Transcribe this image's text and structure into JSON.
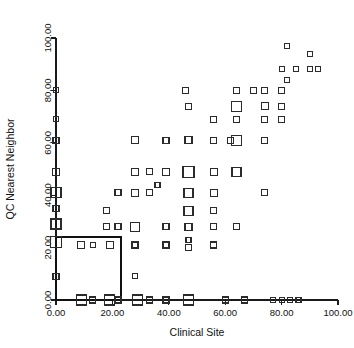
{
  "chart_data": {
    "type": "scatter",
    "title": "",
    "xlabel": "Clinical Site",
    "ylabel": "QC Nearest Neighbor",
    "xlim": [
      0,
      100
    ],
    "ylim": [
      0,
      100
    ],
    "grid": false,
    "legend": null,
    "xticks": [
      0,
      20,
      40,
      60,
      80,
      100
    ],
    "yticks": [
      0,
      20,
      40,
      60,
      80,
      100
    ],
    "xtick_labels": [
      "0.00",
      "20.00",
      "40.00",
      "60.00",
      "80.00",
      "100.00"
    ],
    "ytick_labels": [
      "0.00",
      "20.00",
      "40.00",
      "60.00",
      "80.00",
      "100.00"
    ],
    "marker_shape": "open-square",
    "marker_note": "Marker size varies with bin count; sizes given in px side length.",
    "points": [
      {
        "x": 0,
        "y": 80,
        "size": 5
      },
      {
        "x": 0,
        "y": 69,
        "size": 5
      },
      {
        "x": 0,
        "y": 61,
        "size": 6
      },
      {
        "x": 0,
        "y": 49,
        "size": 7
      },
      {
        "x": 0,
        "y": 41,
        "size": 10
      },
      {
        "x": 0,
        "y": 35,
        "size": 6
      },
      {
        "x": 0,
        "y": 29,
        "size": 10
      },
      {
        "x": 0,
        "y": 22,
        "size": 11
      },
      {
        "x": 0,
        "y": 9,
        "size": 6
      },
      {
        "x": 9,
        "y": 21,
        "size": 7
      },
      {
        "x": 9,
        "y": 0,
        "size": 10
      },
      {
        "x": 13,
        "y": 21,
        "size": 5
      },
      {
        "x": 13,
        "y": 0,
        "size": 6
      },
      {
        "x": 19,
        "y": 21,
        "size": 7
      },
      {
        "x": 19,
        "y": 0,
        "size": 10
      },
      {
        "x": 18,
        "y": 34,
        "size": 6
      },
      {
        "x": 18,
        "y": 28,
        "size": 6
      },
      {
        "x": 22,
        "y": 41,
        "size": 6
      },
      {
        "x": 22,
        "y": 28,
        "size": 6
      },
      {
        "x": 22,
        "y": 0,
        "size": 6
      },
      {
        "x": 28,
        "y": 61,
        "size": 7
      },
      {
        "x": 28,
        "y": 49,
        "size": 7
      },
      {
        "x": 28,
        "y": 41,
        "size": 7
      },
      {
        "x": 28,
        "y": 28,
        "size": 9
      },
      {
        "x": 28,
        "y": 21,
        "size": 6
      },
      {
        "x": 28,
        "y": 9,
        "size": 5
      },
      {
        "x": 29,
        "y": 0,
        "size": 10
      },
      {
        "x": 33,
        "y": 49,
        "size": 6
      },
      {
        "x": 33,
        "y": 41,
        "size": 6
      },
      {
        "x": 33,
        "y": 0,
        "size": 6
      },
      {
        "x": 36,
        "y": 44,
        "size": 5
      },
      {
        "x": 39,
        "y": 61,
        "size": 6
      },
      {
        "x": 39,
        "y": 49,
        "size": 7
      },
      {
        "x": 39,
        "y": 28,
        "size": 6
      },
      {
        "x": 39,
        "y": 21,
        "size": 6
      },
      {
        "x": 39,
        "y": 0,
        "size": 6
      },
      {
        "x": 46,
        "y": 80,
        "size": 6
      },
      {
        "x": 47,
        "y": 74,
        "size": 6
      },
      {
        "x": 47,
        "y": 61,
        "size": 7
      },
      {
        "x": 47,
        "y": 49,
        "size": 11
      },
      {
        "x": 47,
        "y": 41,
        "size": 9
      },
      {
        "x": 47,
        "y": 34,
        "size": 9
      },
      {
        "x": 47,
        "y": 28,
        "size": 7
      },
      {
        "x": 47,
        "y": 23,
        "size": 5
      },
      {
        "x": 47,
        "y": 20,
        "size": 6
      },
      {
        "x": 47,
        "y": 0,
        "size": 10
      },
      {
        "x": 56,
        "y": 69,
        "size": 6
      },
      {
        "x": 56,
        "y": 61,
        "size": 6
      },
      {
        "x": 56,
        "y": 49,
        "size": 7
      },
      {
        "x": 56,
        "y": 41,
        "size": 7
      },
      {
        "x": 56,
        "y": 34,
        "size": 6
      },
      {
        "x": 56,
        "y": 28,
        "size": 6
      },
      {
        "x": 56,
        "y": 21,
        "size": 6
      },
      {
        "x": 60,
        "y": 0,
        "size": 6
      },
      {
        "x": 62,
        "y": 61,
        "size": 6
      },
      {
        "x": 64,
        "y": 80,
        "size": 6
      },
      {
        "x": 64,
        "y": 74,
        "size": 10
      },
      {
        "x": 64,
        "y": 69,
        "size": 6
      },
      {
        "x": 64,
        "y": 61,
        "size": 10
      },
      {
        "x": 64,
        "y": 49,
        "size": 9
      },
      {
        "x": 64,
        "y": 28,
        "size": 6
      },
      {
        "x": 67,
        "y": 0,
        "size": 6
      },
      {
        "x": 70,
        "y": 80,
        "size": 6
      },
      {
        "x": 74,
        "y": 80,
        "size": 6
      },
      {
        "x": 74,
        "y": 74,
        "size": 7
      },
      {
        "x": 74,
        "y": 69,
        "size": 6
      },
      {
        "x": 74,
        "y": 61,
        "size": 6
      },
      {
        "x": 74,
        "y": 41,
        "size": 6
      },
      {
        "x": 77,
        "y": 0,
        "size": 5
      },
      {
        "x": 80,
        "y": 80,
        "size": 6
      },
      {
        "x": 80,
        "y": 74,
        "size": 6
      },
      {
        "x": 80,
        "y": 69,
        "size": 6
      },
      {
        "x": 80,
        "y": 0,
        "size": 5
      },
      {
        "x": 80,
        "y": 88,
        "size": 5
      },
      {
        "x": 82,
        "y": 97,
        "size": 5
      },
      {
        "x": 82,
        "y": 84,
        "size": 5
      },
      {
        "x": 83,
        "y": 0,
        "size": 5
      },
      {
        "x": 85,
        "y": 88,
        "size": 5
      },
      {
        "x": 86,
        "y": 0,
        "size": 5
      },
      {
        "x": 90,
        "y": 94,
        "size": 5
      },
      {
        "x": 90,
        "y": 88,
        "size": 5
      },
      {
        "x": 93,
        "y": 88,
        "size": 5
      }
    ],
    "selection_box": {
      "x0": 0,
      "y0": 0,
      "x1": 23,
      "y1": 24,
      "label": "selection-rectangle"
    }
  }
}
